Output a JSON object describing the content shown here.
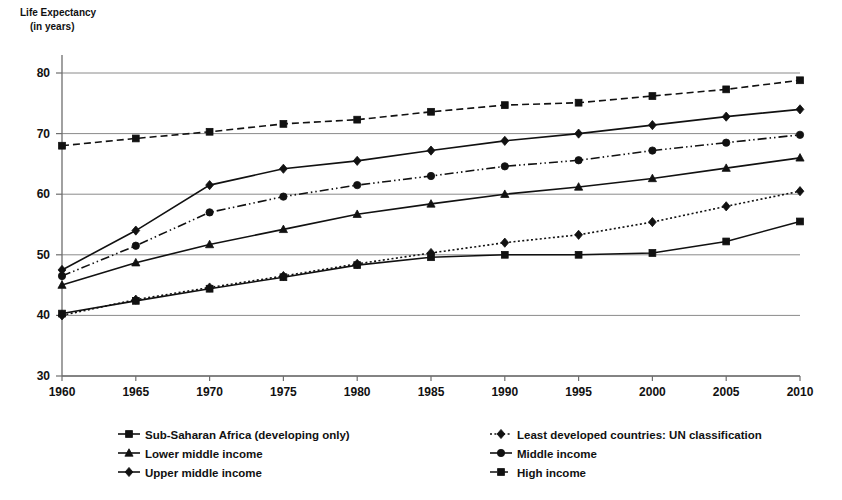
{
  "chart_data": {
    "type": "line",
    "title": "Life Expectancy",
    "subtitle": "(in years)",
    "ylabel": "Life Expectancy (in years)",
    "xlabel": "",
    "grid": true,
    "legend_position": "bottom",
    "ylim": [
      30,
      80
    ],
    "yticks": [
      30,
      40,
      50,
      60,
      70,
      80
    ],
    "xlim": [
      1960,
      2010
    ],
    "categories": [
      1960,
      1965,
      1970,
      1975,
      1980,
      1985,
      1990,
      1995,
      2000,
      2005,
      2010
    ],
    "x": [
      1960,
      1965,
      1970,
      1975,
      1980,
      1985,
      1990,
      1995,
      2000,
      2005,
      2010
    ],
    "xtick_labels": [
      "1960",
      "1965",
      "1970",
      "1975",
      "1980",
      "1985",
      "1990",
      "1995",
      "2000",
      "2005",
      "2010"
    ],
    "ytick_labels": [
      "30",
      "40",
      "50",
      "60",
      "70",
      "80"
    ],
    "series": [
      {
        "name": "Sub-Saharan Africa (developing only)",
        "marker": "square",
        "dash": "solid",
        "color": "#111111",
        "values": [
          40.3,
          42.4,
          44.4,
          46.3,
          48.3,
          49.6,
          50.0,
          50.0,
          50.3,
          52.2,
          55.5
        ]
      },
      {
        "name": "Least developed countries: UN classification",
        "marker": "diamond",
        "dash": "dotted",
        "color": "#111111",
        "values": [
          40.0,
          42.6,
          44.6,
          46.5,
          48.5,
          50.3,
          52.0,
          53.3,
          55.4,
          58.0,
          60.5
        ]
      },
      {
        "name": "Lower middle income",
        "marker": "triangle",
        "dash": "solid",
        "color": "#111111",
        "values": [
          45.0,
          48.7,
          51.7,
          54.2,
          56.7,
          58.4,
          60.0,
          61.2,
          62.6,
          64.3,
          66.0
        ]
      },
      {
        "name": "Middle income",
        "marker": "circle",
        "dash": "dashdotdot",
        "color": "#111111",
        "values": [
          46.5,
          51.5,
          57.0,
          59.6,
          61.5,
          63.0,
          64.6,
          65.6,
          67.2,
          68.5,
          69.8
        ]
      },
      {
        "name": "Upper middle income",
        "marker": "diamond",
        "dash": "solid",
        "color": "#111111",
        "values": [
          47.5,
          54.0,
          61.5,
          64.2,
          65.5,
          67.2,
          68.8,
          70.0,
          71.4,
          72.8,
          74.0
        ]
      },
      {
        "name": "High income",
        "marker": "square",
        "dash": "dashed",
        "color": "#111111",
        "values": [
          68.0,
          69.2,
          70.3,
          71.6,
          72.3,
          73.6,
          74.7,
          75.1,
          76.2,
          77.3,
          78.8
        ]
      }
    ],
    "legend": [
      {
        "label": "Sub-Saharan Africa (developing only)",
        "marker": "square",
        "dash": "solid",
        "column": 0
      },
      {
        "label": "Lower middle income",
        "marker": "triangle",
        "dash": "solid",
        "column": 0
      },
      {
        "label": "Upper middle income",
        "marker": "diamond",
        "dash": "solid",
        "column": 0
      },
      {
        "label": "Least developed countries: UN classification",
        "marker": "diamond",
        "dash": "dotted",
        "column": 1
      },
      {
        "label": "Middle income",
        "marker": "circle",
        "dash": "solid",
        "column": 1
      },
      {
        "label": "High income",
        "marker": "square",
        "dash": "dashed",
        "column": 1
      }
    ]
  }
}
